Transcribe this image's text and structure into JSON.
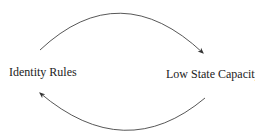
{
  "diagram": {
    "nodes": [
      {
        "id": "identity-rules",
        "label": "Identity Rules"
      },
      {
        "id": "low-state-capacity",
        "label": "Low State Capacity"
      }
    ],
    "edges": [
      {
        "from": "identity-rules",
        "to": "low-state-capacity",
        "style": "curved-arrow-top"
      },
      {
        "from": "low-state-capacity",
        "to": "identity-rules",
        "style": "curved-arrow-bottom"
      }
    ],
    "colors": {
      "line": "#333333",
      "text": "#222222"
    }
  }
}
